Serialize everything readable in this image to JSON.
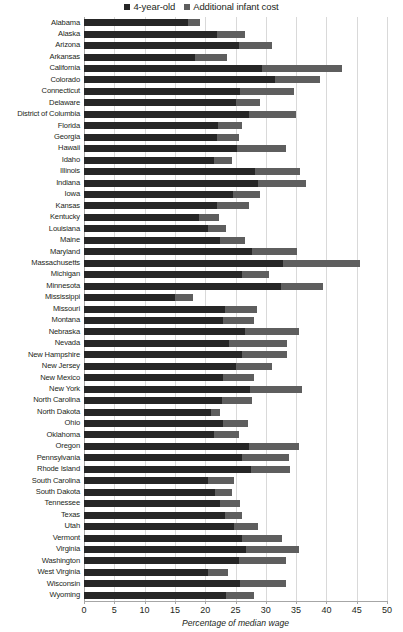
{
  "legend": {
    "position": "top-center",
    "entries": [
      {
        "label": "4-year-old",
        "color": "#262626",
        "key": "four_year_old"
      },
      {
        "label": "Additional infant cost",
        "color": "#5e5e5e",
        "key": "additional_infant_cost"
      }
    ]
  },
  "axis": {
    "xlabel": "Percentage of median wage",
    "ticks": [
      "0",
      "5",
      "10",
      "15",
      "20",
      "25",
      "30",
      "35",
      "40",
      "45",
      "50"
    ],
    "xmin": 0,
    "xmax": 50,
    "step": 5
  },
  "chart_data": {
    "type": "bar",
    "orientation": "horizontal",
    "stacked": true,
    "title": "",
    "subtitle": "",
    "xlabel": "Percentage of median wage",
    "ylabel": "",
    "xlim": [
      0,
      50
    ],
    "xticks": [
      0,
      5,
      10,
      15,
      20,
      25,
      30,
      35,
      40,
      45,
      50
    ],
    "grid": "vertical",
    "legend_position": "top-center",
    "categories": [
      "Alabama",
      "Alaska",
      "Arizona",
      "Arkansas",
      "California",
      "Colorado",
      "Connecticut",
      "Delaware",
      "District of Columbia",
      "Florida",
      "Georgia",
      "Hawaii",
      "Idaho",
      "Illinois",
      "Indiana",
      "Iowa",
      "Kansas",
      "Kentucky",
      "Louisiana",
      "Maine",
      "Maryland",
      "Massachusetts",
      "Michigan",
      "Minnesota",
      "Mississippi",
      "Missouri",
      "Montana",
      "Nebraska",
      "Nevada",
      "New Hampshire",
      "New Jersey",
      "New Mexico",
      "New York",
      "North Carolina",
      "North Dakota",
      "Ohio",
      "Oklahoma",
      "Oregon",
      "Pennsylvania",
      "Rhode Island",
      "South Carolina",
      "South Dakota",
      "Tennessee",
      "Texas",
      "Utah",
      "Vermont",
      "Virginia",
      "Washington",
      "West Virginia",
      "Wisconsin",
      "Wyoming"
    ],
    "series": [
      {
        "name": "4-year-old",
        "color": "#262626",
        "values": [
          17.2,
          21.9,
          25.5,
          18.3,
          29.4,
          31.5,
          25.7,
          25.0,
          27.2,
          22.1,
          22.0,
          25.3,
          21.5,
          28.2,
          28.7,
          24.6,
          22.0,
          19.0,
          20.5,
          22.4,
          27.8,
          32.8,
          26.0,
          32.5,
          15.0,
          23.3,
          22.9,
          26.5,
          24.0,
          26.0,
          25.0,
          23.0,
          27.4,
          22.8,
          21.0,
          23.0,
          21.5,
          27.2,
          26.0,
          27.5,
          20.5,
          21.6,
          22.5,
          23.3,
          24.7,
          26.0,
          26.8,
          25.5,
          20.5,
          25.7,
          23.5
        ]
      },
      {
        "name": "Additional infant cost",
        "color": "#5e5e5e",
        "values": [
          1.9,
          4.7,
          5.6,
          5.3,
          13.2,
          7.5,
          9.0,
          4.0,
          7.8,
          4.0,
          3.5,
          8.0,
          3.0,
          7.4,
          8.0,
          4.4,
          5.2,
          3.3,
          3.0,
          4.2,
          7.4,
          12.7,
          4.5,
          7.0,
          3.0,
          5.3,
          5.2,
          8.9,
          9.5,
          7.5,
          6.0,
          5.0,
          8.5,
          5.0,
          1.5,
          4.0,
          4.0,
          8.3,
          7.8,
          6.5,
          4.2,
          2.9,
          3.3,
          2.8,
          4.0,
          6.7,
          8.7,
          7.8,
          3.3,
          7.6,
          4.5
        ]
      }
    ],
    "totals": [
      19.1,
      26.6,
      31.1,
      23.6,
      42.6,
      39.0,
      34.7,
      29.0,
      35.0,
      26.1,
      25.5,
      33.3,
      24.5,
      35.6,
      36.7,
      29.0,
      27.2,
      22.3,
      23.5,
      26.6,
      35.2,
      45.5,
      30.5,
      39.5,
      18.0,
      28.6,
      28.1,
      35.4,
      33.5,
      33.5,
      31.0,
      28.0,
      35.9,
      27.8,
      22.5,
      27.0,
      25.5,
      35.5,
      33.8,
      34.0,
      24.7,
      24.5,
      25.8,
      26.1,
      28.7,
      32.7,
      35.5,
      33.3,
      23.8,
      33.3,
      28.0
    ]
  }
}
